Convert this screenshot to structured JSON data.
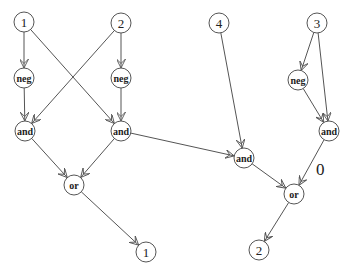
{
  "diagram": {
    "type": "boolean-circuit-graph",
    "node_radius": 10,
    "colors": {
      "stroke": "#555555",
      "text": "#222222",
      "background": "#ffffff"
    },
    "nodes": [
      {
        "id": "in1",
        "label": "1",
        "kind": "input",
        "x": 24,
        "y": 22
      },
      {
        "id": "in2",
        "label": "2",
        "kind": "input",
        "x": 121,
        "y": 23
      },
      {
        "id": "in4",
        "label": "4",
        "kind": "input",
        "x": 219,
        "y": 23
      },
      {
        "id": "in3",
        "label": "3",
        "kind": "input",
        "x": 317,
        "y": 23
      },
      {
        "id": "negL",
        "label": "neg",
        "kind": "op",
        "x": 24,
        "y": 78
      },
      {
        "id": "negM",
        "label": "neg",
        "kind": "op",
        "x": 121,
        "y": 78
      },
      {
        "id": "negR",
        "label": "neg",
        "kind": "op",
        "x": 298,
        "y": 80
      },
      {
        "id": "andL",
        "label": "and",
        "kind": "op",
        "x": 25,
        "y": 131
      },
      {
        "id": "andM",
        "label": "and",
        "kind": "op",
        "x": 121,
        "y": 131
      },
      {
        "id": "andR",
        "label": "and",
        "kind": "op",
        "x": 329,
        "y": 131
      },
      {
        "id": "andC",
        "label": "and",
        "kind": "op",
        "x": 244,
        "y": 158
      },
      {
        "id": "orL",
        "label": "or",
        "kind": "op",
        "x": 74,
        "y": 185
      },
      {
        "id": "orR",
        "label": "or",
        "kind": "op",
        "x": 294,
        "y": 194
      },
      {
        "id": "out1",
        "label": "1",
        "kind": "output",
        "x": 146,
        "y": 252
      },
      {
        "id": "out2",
        "label": "2",
        "kind": "output",
        "x": 259,
        "y": 250
      }
    ],
    "edges": [
      {
        "from": "in1",
        "to": "negL"
      },
      {
        "from": "in1",
        "to": "andM"
      },
      {
        "from": "in2",
        "to": "andL"
      },
      {
        "from": "in2",
        "to": "negM"
      },
      {
        "from": "negL",
        "to": "andL"
      },
      {
        "from": "negM",
        "to": "andM"
      },
      {
        "from": "andL",
        "to": "orL"
      },
      {
        "from": "andM",
        "to": "orL"
      },
      {
        "from": "andM",
        "to": "andC"
      },
      {
        "from": "in4",
        "to": "andC"
      },
      {
        "from": "in3",
        "to": "negR"
      },
      {
        "from": "in3",
        "to": "andR"
      },
      {
        "from": "negR",
        "to": "andR"
      },
      {
        "from": "andR",
        "to": "orR",
        "label": "0"
      },
      {
        "from": "andC",
        "to": "orR"
      },
      {
        "from": "orL",
        "to": "out1"
      },
      {
        "from": "orR",
        "to": "out2"
      }
    ],
    "edge_labels": [
      {
        "text": "0",
        "x": 316,
        "y": 175
      }
    ]
  }
}
